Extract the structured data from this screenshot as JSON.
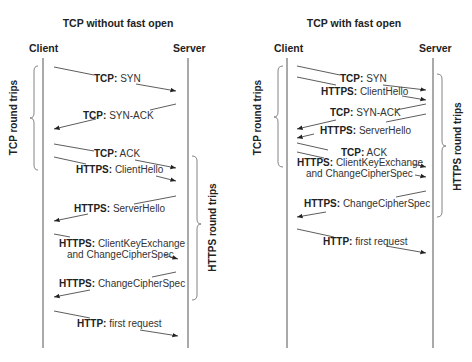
{
  "diagrams": [
    {
      "title": "TCP without fast open",
      "client_label": "Client",
      "server_label": "Server",
      "bracket_left_label": "TCP round trips",
      "bracket_right_label": "HTTPS round trips",
      "messages": [
        {
          "protocol": "TCP:",
          "text": "SYN",
          "direction": "client-to-server"
        },
        {
          "protocol": "TCP:",
          "text": "SYN-ACK",
          "direction": "server-to-client"
        },
        {
          "protocol": "TCP:",
          "text": "ACK",
          "direction": "client-to-server"
        },
        {
          "protocol": "HTTPS:",
          "text": "ClientHello",
          "direction": "client-to-server"
        },
        {
          "protocol": "HTTPS:",
          "text": "ServerHello",
          "direction": "server-to-client"
        },
        {
          "protocol": "HTTPS:",
          "text": "ClientKeyExchange",
          "text2": "and ChangeCipherSpec",
          "direction": "client-to-server"
        },
        {
          "protocol": "HTTPS:",
          "text": "ChangeCipherSpec",
          "direction": "server-to-client"
        },
        {
          "protocol": "HTTP:",
          "text": "first request",
          "direction": "client-to-server"
        }
      ]
    },
    {
      "title": "TCP with fast open",
      "client_label": "Client",
      "server_label": "Server",
      "bracket_left_label": "TCP round trips",
      "bracket_right_label": "HTTPS round trips",
      "messages": [
        {
          "protocol": "TCP:",
          "text": "SYN",
          "direction": "client-to-server"
        },
        {
          "protocol": "HTTPS:",
          "text": "ClientHello",
          "direction": "client-to-server"
        },
        {
          "protocol": "TCP:",
          "text": "SYN-ACK",
          "direction": "server-to-client"
        },
        {
          "protocol": "HTTPS:",
          "text": "ServerHello",
          "direction": "server-to-client"
        },
        {
          "protocol": "TCP:",
          "text": "ACK",
          "direction": "client-to-server"
        },
        {
          "protocol": "HTTPS:",
          "text": "ClientKeyExchange",
          "text2": "and ChangeCipherSpec",
          "direction": "client-to-server"
        },
        {
          "protocol": "HTTPS:",
          "text": "ChangeCipherSpec",
          "direction": "server-to-client"
        },
        {
          "protocol": "HTTP:",
          "text": "first request",
          "direction": "client-to-server"
        }
      ]
    }
  ],
  "colors": {
    "line": "#333333",
    "lifeline": "#555555",
    "bracket": "#666666",
    "background": "#ffffff"
  }
}
